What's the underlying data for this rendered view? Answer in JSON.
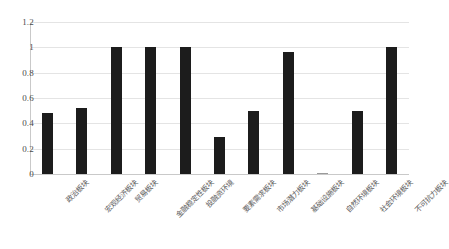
{
  "chart_data": {
    "type": "bar",
    "title": "",
    "subtitle": "",
    "xlabel": "",
    "ylabel": "",
    "ylim": [
      0,
      1.2
    ],
    "ytick_labels": [
      "1.2",
      "1",
      "0.8",
      "0.6",
      "0.4",
      "0.2",
      "0"
    ],
    "ytick_values": [
      1.2,
      1,
      0.8,
      0.6,
      0.4,
      0.2,
      0
    ],
    "grid": "horizontal",
    "legend": "none",
    "bar_color": "#1c1c1c",
    "grid_color": "#e4e4e4",
    "categories": [
      "政治板块",
      "宏观经济板块",
      "贸易板块",
      "金融稳定性板块",
      "投融资环境",
      "要素需求板块",
      "市场潜力板块",
      "基础设施板块",
      "自然环境板块",
      "社会环境板块",
      "不可抗力板块"
    ],
    "values": [
      0.48,
      0.52,
      1.0,
      1.0,
      1.0,
      0.29,
      0.5,
      0.96,
      0.01,
      0.5,
      1.0
    ]
  }
}
